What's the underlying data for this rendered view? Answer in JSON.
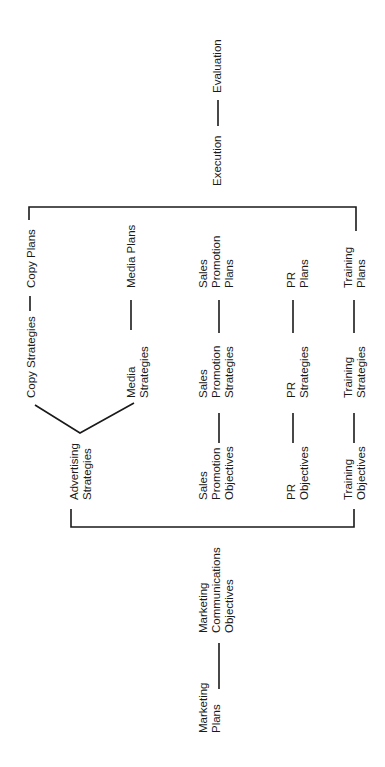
{
  "diagram": {
    "title": "",
    "orientation": "rotated-90-ccw",
    "nodes": {
      "marketing_plans": [
        "Marketing",
        "Plans"
      ],
      "marketing_comm_objectives": [
        "Marketing",
        "Communications",
        "Objectives"
      ],
      "advertising_strategies": [
        "Advertising",
        "Strategies"
      ],
      "copy_strategies": [
        "Copy Strategies"
      ],
      "copy_plans": [
        "Copy Plans"
      ],
      "media_strategies": [
        "Media",
        "Strategies"
      ],
      "media_plans": [
        "Media Plans"
      ],
      "sales_promotion_objectives": [
        "Sales",
        "Promotion",
        "Objectives"
      ],
      "sales_promotion_strategies": [
        "Sales",
        "Promotion",
        "Strategies"
      ],
      "sales_promotion_plans": [
        "Sales",
        "Promotion",
        "Plans"
      ],
      "pr_objectives": [
        "PR",
        "Objectives"
      ],
      "pr_strategies": [
        "PR",
        "Strategies"
      ],
      "pr_plans": [
        "PR",
        "Plans"
      ],
      "training_objectives": [
        "Training",
        "Objectives"
      ],
      "training_strategies": [
        "Training",
        "Strategies"
      ],
      "training_plans": [
        "Training",
        "Plans"
      ],
      "execution": [
        "Execution"
      ],
      "evaluation": [
        "Evaluation"
      ]
    },
    "edges": [
      [
        "Marketing Plans",
        "Marketing Communications Objectives"
      ],
      [
        "Marketing Communications Objectives",
        "Advertising Strategies"
      ],
      [
        "Marketing Communications Objectives",
        "Sales Promotion Objectives"
      ],
      [
        "Marketing Communications Objectives",
        "PR Objectives"
      ],
      [
        "Marketing Communications Objectives",
        "Training Objectives"
      ],
      [
        "Advertising Strategies",
        "Copy Strategies"
      ],
      [
        "Advertising Strategies",
        "Media Strategies"
      ],
      [
        "Copy Strategies",
        "Copy Plans"
      ],
      [
        "Media Strategies",
        "Media Plans"
      ],
      [
        "Sales Promotion Objectives",
        "Sales Promotion Strategies"
      ],
      [
        "Sales Promotion Strategies",
        "Sales Promotion Plans"
      ],
      [
        "PR Objectives",
        "PR Strategies"
      ],
      [
        "PR Strategies",
        "PR Plans"
      ],
      [
        "Training Objectives",
        "Training Strategies"
      ],
      [
        "Training Strategies",
        "Training Plans"
      ],
      [
        "Copy Plans",
        "Execution"
      ],
      [
        "Media Plans",
        "Execution"
      ],
      [
        "Sales Promotion Plans",
        "Execution"
      ],
      [
        "PR Plans",
        "Execution"
      ],
      [
        "Training Plans",
        "Execution"
      ],
      [
        "Execution",
        "Evaluation"
      ]
    ]
  }
}
